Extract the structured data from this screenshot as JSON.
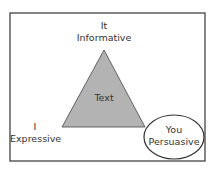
{
  "diagram": {
    "type": "communication-triangle",
    "center": "Text",
    "top": {
      "pronoun": "It",
      "function": "Informative"
    },
    "left": {
      "pronoun": "I",
      "function": "Expressive"
    },
    "right": {
      "pronoun": "You",
      "function": "Persuasive",
      "highlighted": true
    },
    "colors": {
      "triangle_fill": "#b3b3b3",
      "stroke": "#333333",
      "frame": "#444444"
    }
  }
}
